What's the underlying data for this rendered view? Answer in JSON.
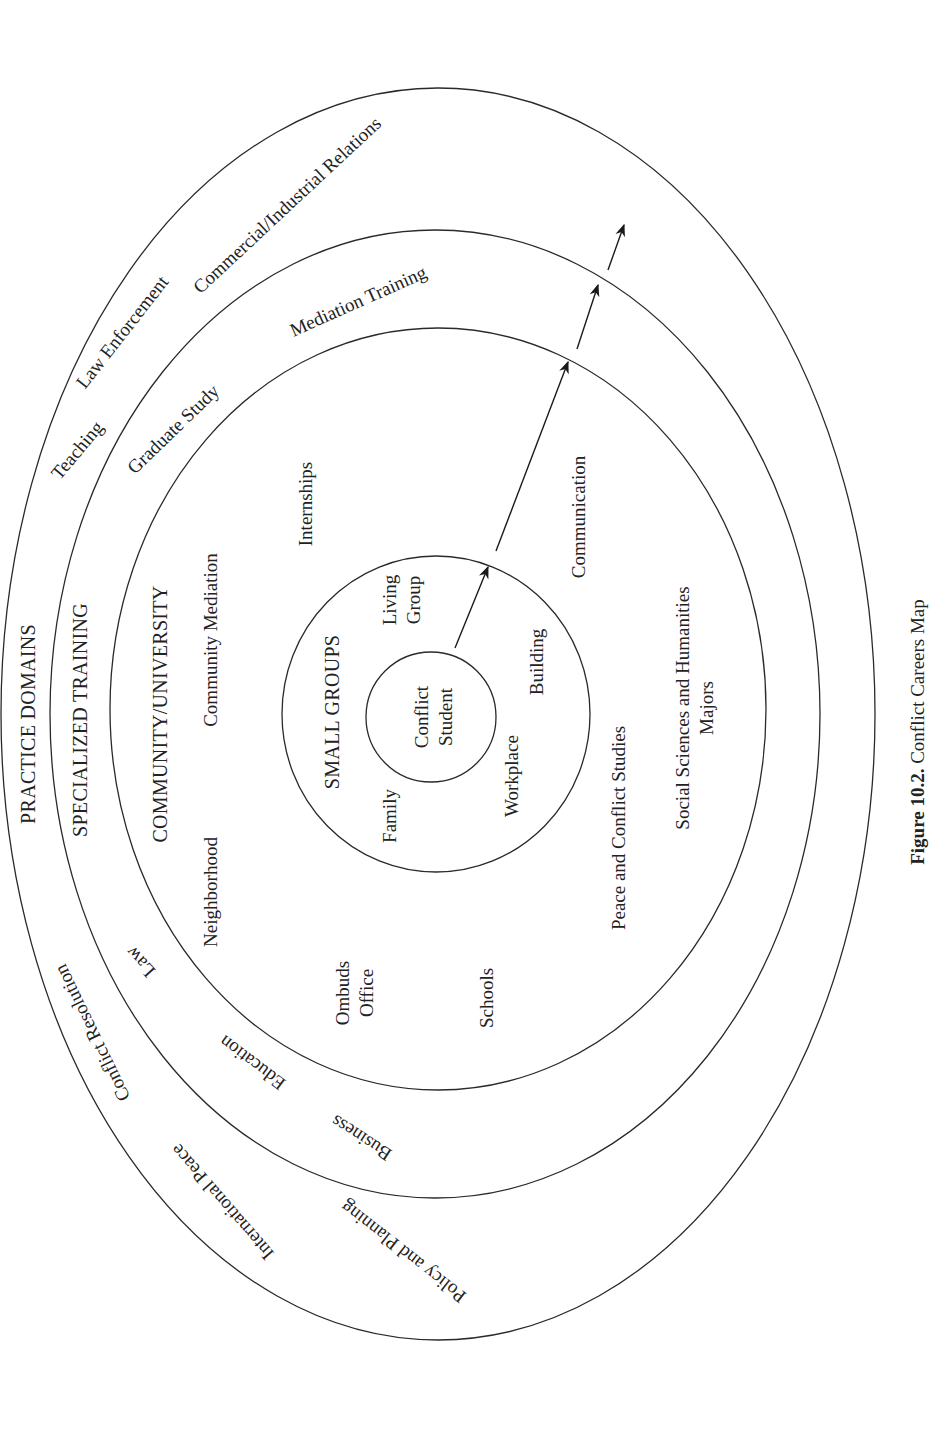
{
  "figure": {
    "caption_number": "Figure 10.2.",
    "caption_title": "Conflict Careers Map",
    "line_color": "#2a2a2a",
    "text_color": "#222222"
  },
  "rings": {
    "practice_domains": {
      "title": "PRACTICE DOMAINS",
      "items": [
        "Teaching",
        "Law Enforcement",
        "Commercial/Industrial Relations",
        "Conflict Resolution",
        "International Peace",
        "Policy and Planning"
      ]
    },
    "specialized_training": {
      "title": "SPECIALIZED TRAINING",
      "items": [
        "Graduate Study",
        "Mediation Training",
        "Law",
        "Education",
        "Business"
      ]
    },
    "community_university": {
      "title": "COMMUNITY/UNIVERSITY",
      "items": [
        "Community Mediation",
        "Neighborhood",
        "Internships",
        "Communication",
        "Ombuds",
        "Office",
        "Schools",
        "Peace and Conflict Studies",
        "Social Sciences and Humanities",
        "Majors"
      ]
    },
    "small_groups": {
      "title": "SMALL GROUPS",
      "items": [
        "Living",
        "Group",
        "Family",
        "Workplace",
        "Building"
      ]
    },
    "center": {
      "line1": "Conflict",
      "line2": "Student"
    }
  },
  "geometry": {
    "ellipses": [
      {
        "name": "practice-domains-ellipse",
        "cx": 438,
        "cy": 714,
        "rx": 437,
        "ry": 626
      },
      {
        "name": "specialized-training-ellipse",
        "cx": 435,
        "cy": 714,
        "rx": 385,
        "ry": 484
      },
      {
        "name": "community-university-ellipse",
        "cx": 438,
        "cy": 709,
        "rx": 328,
        "ry": 381
      },
      {
        "name": "small-groups-circle",
        "cx": 436,
        "cy": 714,
        "rx": 154,
        "ry": 158
      },
      {
        "name": "conflict-student-circle",
        "cx": 431,
        "cy": 717,
        "rx": 65,
        "ry": 65
      }
    ],
    "arrows": [
      {
        "x1": 455,
        "y1": 648,
        "x2": 488,
        "y2": 567
      },
      {
        "x1": 496,
        "y1": 551,
        "x2": 568,
        "y2": 362
      },
      {
        "x1": 577,
        "y1": 349,
        "x2": 598,
        "y2": 285
      },
      {
        "x1": 608,
        "y1": 270,
        "x2": 624,
        "y2": 225
      }
    ]
  }
}
